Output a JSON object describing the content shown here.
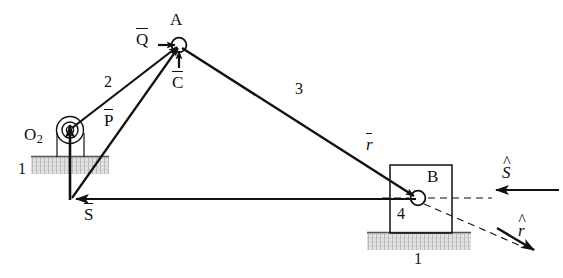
{
  "figure": {
    "type": "kinematic-mechanism-diagram",
    "background_color": "#ffffff",
    "line_color": "#111111",
    "hatch_color": "#b9b9b9"
  },
  "points": [
    {
      "id": "O2",
      "label": "O",
      "subscript": "2",
      "x": 70,
      "y": 130
    },
    {
      "id": "A",
      "label": "A",
      "x": 179,
      "y": 45
    },
    {
      "id": "B",
      "label": "B",
      "x": 418,
      "y": 198
    },
    {
      "id": "J",
      "label": "",
      "x": 70,
      "y": 200
    }
  ],
  "links": [
    {
      "name": "ground-left",
      "number": "1",
      "label_x": 18,
      "label_y": 168
    },
    {
      "name": "crank",
      "number": "2",
      "label_x": 104,
      "label_y": 81
    },
    {
      "name": "coupler",
      "number": "3",
      "label_x": 295,
      "label_y": 89
    },
    {
      "name": "slider-block",
      "number": "4",
      "label_x": 397,
      "label_y": 213
    },
    {
      "name": "ground-right",
      "number": "1",
      "label_x": 421,
      "label_y": 257
    }
  ],
  "vectors": [
    {
      "name": "Q-bar",
      "symbol": "Q",
      "style": "overbar",
      "italic": false,
      "label_x": 139,
      "label_y": 36
    },
    {
      "name": "C-bar",
      "symbol": "C",
      "style": "overbar",
      "italic": false,
      "label_x": 174,
      "label_y": 83
    },
    {
      "name": "P-bar",
      "symbol": "P",
      "style": "overbar",
      "italic": false,
      "label_x": 106,
      "label_y": 118
    },
    {
      "name": "S-bar",
      "symbol": "S",
      "style": "overbar",
      "italic": false,
      "label_x": 86,
      "label_y": 213
    },
    {
      "name": "r-bar",
      "symbol": "r",
      "style": "overbar",
      "italic": true,
      "label_x": 368,
      "label_y": 142
    }
  ],
  "unit_vectors": [
    {
      "name": "s-hat",
      "symbol": "S",
      "style": "hat",
      "label_x": 505,
      "label_y": 168
    },
    {
      "name": "r-hat",
      "symbol": "r",
      "style": "hat",
      "italic": true,
      "label_x": 521,
      "label_y": 228
    }
  ],
  "labels": {
    "point_A": "A",
    "point_B": "B",
    "point_O2": "O",
    "point_O2_sub": "2",
    "link_1_left": "1",
    "link_1_right": "1",
    "link_2": "2",
    "link_3": "3",
    "link_4": "4",
    "vec_Q": "Q",
    "vec_C": "C",
    "vec_P": "P",
    "vec_S": "S",
    "vec_r": "r",
    "unit_S": "S",
    "unit_r": "r"
  }
}
